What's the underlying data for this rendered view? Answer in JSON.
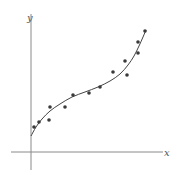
{
  "chart_data": {
    "type": "scatter",
    "title": "",
    "xlabel": "x",
    "ylabel": "y",
    "grid": false,
    "legend": null,
    "points_px": [
      [
        34,
        127
      ],
      [
        39,
        122
      ],
      [
        49,
        120
      ],
      [
        50,
        107
      ],
      [
        65,
        107
      ],
      [
        73,
        95
      ],
      [
        89,
        93
      ],
      [
        100,
        87
      ],
      [
        113,
        72
      ],
      [
        125,
        61
      ],
      [
        127,
        75
      ],
      [
        138,
        53
      ],
      [
        138,
        42
      ],
      [
        145,
        31
      ]
    ],
    "curve_px": [
      [
        31,
        136
      ],
      [
        36,
        127
      ],
      [
        42,
        119
      ],
      [
        50,
        111
      ],
      [
        60,
        104
      ],
      [
        72,
        97
      ],
      [
        85,
        92
      ],
      [
        98,
        87
      ],
      [
        110,
        81
      ],
      [
        120,
        74
      ],
      [
        128,
        65
      ],
      [
        134,
        56
      ],
      [
        139,
        46
      ],
      [
        143,
        37
      ],
      [
        146,
        30
      ]
    ],
    "colors": {
      "axis": "#8a8a8a",
      "point": "#3a3a3a",
      "curve": "#444444"
    }
  },
  "labels": {
    "x_axis": "x",
    "y_axis": "y"
  }
}
